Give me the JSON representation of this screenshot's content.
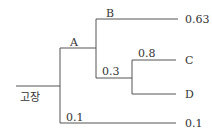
{
  "diagram": {
    "type": "event-tree",
    "root": {
      "label": "고장"
    },
    "nodes": {
      "A": {
        "label": "A"
      },
      "B": {
        "label": "B"
      }
    },
    "branch_labels": {
      "b_to_end": "0.63",
      "a_to_cd": "0.3",
      "cd_upper": "0.8",
      "c": "C",
      "d": "D",
      "root_lower": "0.1",
      "lower_end": "0.1"
    }
  }
}
